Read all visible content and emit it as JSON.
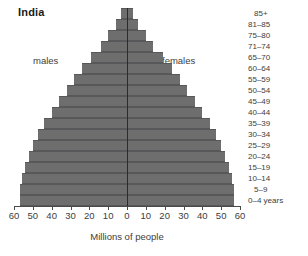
{
  "chart_data": {
    "type": "bar",
    "title": "India",
    "xlabel": "Millions of people",
    "ylabel": "",
    "subtype": "population-pyramid",
    "xlim": [
      -60,
      60
    ],
    "xticks": [
      60,
      50,
      40,
      30,
      20,
      10,
      0,
      10,
      20,
      30,
      40,
      50,
      60
    ],
    "grid": false,
    "legend_position": "inline",
    "units": "millions",
    "categories": [
      "85+",
      "81–85",
      "75–80",
      "71–74",
      "65–70",
      "60–64",
      "55–59",
      "50–54",
      "45–49",
      "40–44",
      "35–39",
      "30–34",
      "25–29",
      "20–24",
      "15–19",
      "10–14",
      "5–9",
      "0–4 years"
    ],
    "series": [
      {
        "name": "males",
        "side": "left",
        "values": [
          3,
          6,
          10,
          14,
          19,
          24,
          28,
          32,
          36,
          40,
          44,
          47,
          50,
          52,
          54,
          56,
          57,
          57
        ]
      },
      {
        "name": "females",
        "side": "right",
        "values": [
          3,
          6,
          10,
          14,
          19,
          24,
          28,
          32,
          36,
          40,
          44,
          47,
          50,
          52,
          54,
          56,
          57,
          57
        ]
      }
    ],
    "bar_color": "#6e6e6e",
    "bar_edge_color": "#58585a",
    "axis_color": "#4a4a4a"
  },
  "labels": {
    "males": "males",
    "females": "females"
  }
}
